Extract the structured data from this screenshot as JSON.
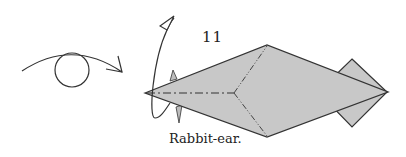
{
  "diagram": {
    "step_number": "11",
    "caption": "Rabbit-ear.",
    "symbols": {
      "view_indicator": "eye-icon",
      "fold_arrow": "rabbit-ear-arrow"
    },
    "colors": {
      "paper_fill": "#c8c8c8",
      "line": "#333333",
      "background": "#ffffff"
    },
    "crease_types": [
      "mountain-fold",
      "valley-fold"
    ]
  }
}
